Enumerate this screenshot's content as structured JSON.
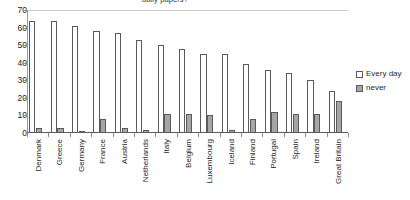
{
  "chart_data": {
    "type": "bar",
    "title": "daily papers?",
    "xlabel": "",
    "ylabel": "",
    "ylim": [
      0,
      70
    ],
    "yticks": [
      0,
      10,
      20,
      30,
      40,
      50,
      60,
      70
    ],
    "grid": false,
    "legend_position": "right",
    "categories": [
      "Denmark",
      "Greece",
      "Germany",
      "France",
      "Austria",
      "Netherlands",
      "Italy",
      "Belgium",
      "Luxembourg",
      "Iceland",
      "Finland",
      "Portugal",
      "Spain",
      "Ireland",
      "Great Britain"
    ],
    "series": [
      {
        "name": "Every day",
        "color": "#ffffff",
        "values": [
          64,
          64,
          61,
          58,
          57,
          53,
          50,
          48,
          45,
          45,
          39,
          36,
          34,
          30,
          24
        ]
      },
      {
        "name": "never",
        "color": "#a6a6a6",
        "values": [
          3,
          3,
          1,
          8,
          3,
          2,
          11,
          11,
          10,
          2,
          8,
          12,
          11,
          11,
          18
        ]
      }
    ]
  },
  "legend": {
    "items": [
      {
        "label": "Every day",
        "swatch": "everyday"
      },
      {
        "label": "never",
        "swatch": "never"
      }
    ]
  }
}
